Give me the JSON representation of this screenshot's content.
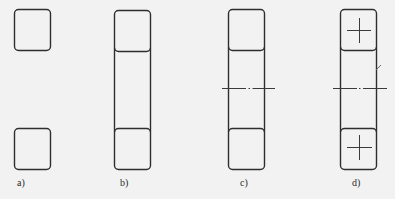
{
  "figure": {
    "panels": [
      {
        "id": "a",
        "label": "a)"
      },
      {
        "id": "b",
        "label": "b)"
      },
      {
        "id": "c",
        "label": "c)"
      },
      {
        "id": "d",
        "label": "d)"
      }
    ]
  },
  "colors": {
    "background": "#f2f2f2",
    "stroke": "#2e2e2e",
    "centerline": "#3a3a3a"
  }
}
